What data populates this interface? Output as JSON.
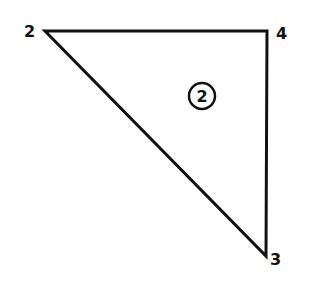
{
  "diagram": {
    "type": "triangle-element",
    "stroke_color": "#111111",
    "background": "#ffffff",
    "nodes": [
      {
        "id": "2",
        "label": "2",
        "x": 45,
        "y": 31
      },
      {
        "id": "4",
        "label": "4",
        "x": 267,
        "y": 31
      },
      {
        "id": "3",
        "label": "3",
        "x": 266,
        "y": 256
      }
    ],
    "edges": [
      {
        "from": "2",
        "to": "4"
      },
      {
        "from": "4",
        "to": "3"
      },
      {
        "from": "3",
        "to": "2"
      }
    ],
    "element": {
      "label": "2",
      "shape": "circle",
      "cx": 202,
      "cy": 96,
      "r": 13
    }
  }
}
